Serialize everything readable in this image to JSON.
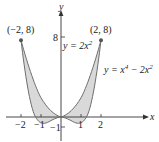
{
  "figure": {
    "axes": {
      "x_label": "x",
      "y_label": "y",
      "x_ticks": [
        "−2",
        "−1",
        "1",
        "2"
      ],
      "y_ticks_positive": [
        "8"
      ],
      "y_ticks_negative": [
        "−1"
      ]
    },
    "curves": [
      {
        "name": "upper",
        "label": "y = 2x",
        "label_exp": "2"
      },
      {
        "name": "lower",
        "label_prefix": "y = x",
        "label_exp1": "4",
        "label_mid": " − 2x",
        "label_exp2": "2"
      }
    ],
    "points": [
      {
        "label": "(−2, 8)"
      },
      {
        "label": "(2, 8)"
      }
    ],
    "colors": {
      "fill": "#d9d9d9",
      "curve": "#6e6e6e",
      "axis": "#333333",
      "dot": "#555555"
    }
  }
}
